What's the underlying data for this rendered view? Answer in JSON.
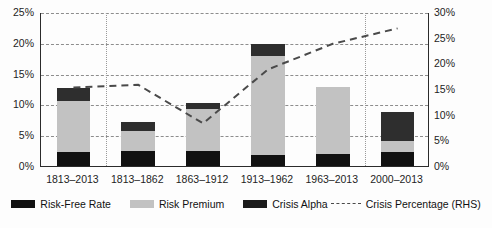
{
  "chart_data": {
    "type": "bar",
    "title": "",
    "subtitle": "",
    "xlabel": "",
    "ylabel": "",
    "ylabel_right": "",
    "categories": [
      "1813–2013",
      "1813–1862",
      "1863–1912",
      "1913–1962",
      "1963–2013",
      "2000–2013"
    ],
    "ylim": [
      0,
      25
    ],
    "ylim_right": [
      0,
      30
    ],
    "yticks": [
      "0%",
      "5%",
      "10%",
      "15%",
      "20%",
      "25%"
    ],
    "yticks_right": [
      "0%",
      "5%",
      "10%",
      "15%",
      "20%",
      "25%",
      "30%"
    ],
    "ytick_values": [
      0,
      5,
      10,
      15,
      20,
      25
    ],
    "ytick_right_values": [
      0,
      5,
      10,
      15,
      20,
      25,
      30
    ],
    "grid": true,
    "legend_position": "bottom",
    "stacked": true,
    "series": [
      {
        "name": "Risk-Free Rate",
        "axis": "left",
        "kind": "bar",
        "color": "#111111",
        "values": [
          2.2,
          2.4,
          2.5,
          1.8,
          2.0,
          2.2
        ]
      },
      {
        "name": "Risk Premium",
        "axis": "left",
        "kind": "bar",
        "color": "#c2c2c2",
        "values": [
          8.4,
          3.3,
          6.8,
          16.1,
          10.9,
          1.9
        ]
      },
      {
        "name": "Crisis Alpha",
        "axis": "left",
        "kind": "bar",
        "color": "#2e2e2e",
        "values": [
          2.1,
          1.5,
          1.0,
          1.9,
          0.0,
          4.6
        ]
      },
      {
        "name": "Crisis Percentage (RHS)",
        "axis": "right",
        "kind": "line",
        "style": "dashed",
        "color": "#4a4a4a",
        "values": [
          15.5,
          16.0,
          8.5,
          19.0,
          24.0,
          27.0
        ]
      }
    ],
    "totals": [
      12.7,
      7.2,
      10.3,
      19.8,
      12.9,
      8.7
    ],
    "separators_after_category_index": [
      0,
      4
    ]
  },
  "legend": {
    "items": [
      {
        "label": "Risk-Free Rate",
        "marker": "filled-square-black"
      },
      {
        "label": "Risk Premium",
        "marker": "filled-square-gray"
      },
      {
        "label": "Crisis Alpha",
        "marker": "filled-square-black"
      },
      {
        "label": "Crisis Percentage (RHS)",
        "marker": "dashed-line"
      }
    ]
  }
}
